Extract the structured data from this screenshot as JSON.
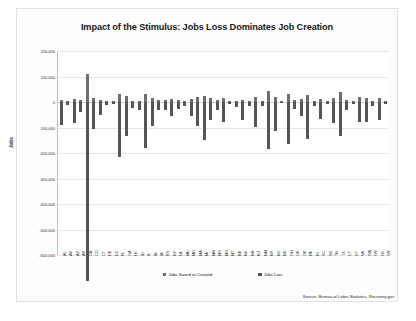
{
  "page": {
    "title": "Impact of the Stimulus: Jobs Loss Dominates Job Creation",
    "source": "Source: Bureau of Labor Statistics, Recovery.gov"
  },
  "legend": {
    "items": [
      {
        "label": "Jobs Saved or Created",
        "color": "#6e6e6e"
      },
      {
        "label": "Jobs Lost",
        "color": "#555555"
      }
    ]
  },
  "chart_data": {
    "type": "bar",
    "title": "Impact of the Stimulus: Jobs Loss Dominates Job Creation",
    "xlabel": "",
    "ylabel": "Jobs",
    "ylim": [
      -600000,
      200000
    ],
    "yticks": [
      200000,
      100000,
      0,
      -100000,
      -200000,
      -300000,
      -400000,
      -500000,
      -600000
    ],
    "ytick_labels": [
      "200,000",
      "100,000",
      "0",
      "-100,000",
      "-200,000",
      "-300,000",
      "-400,000",
      "-500,000",
      "-600,000"
    ],
    "grid": true,
    "legend_position": "bottom",
    "categories": [
      "AL",
      "AK",
      "AZ",
      "AR",
      "CA",
      "CO",
      "CT",
      "DE",
      "DC",
      "FL",
      "GA",
      "HI",
      "ID",
      "IL",
      "IN",
      "IA",
      "KS",
      "KY",
      "LA",
      "ME",
      "MD",
      "MA",
      "MI",
      "MN",
      "MS",
      "MO",
      "MT",
      "NE",
      "NV",
      "NH",
      "NJ",
      "NM",
      "NY",
      "NC",
      "ND",
      "OH",
      "OK",
      "OR",
      "PA",
      "RI",
      "SC",
      "SD",
      "TN",
      "TX",
      "UT",
      "VT",
      "VA",
      "WA",
      "WV",
      "WI",
      "WY"
    ],
    "series": [
      {
        "name": "Jobs Lost",
        "values": [
          -92000,
          -12000,
          -81000,
          -38000,
          -700000,
          -105000,
          -52000,
          -11000,
          -9000,
          -215000,
          -133000,
          -22000,
          -31000,
          -181000,
          -96000,
          -33000,
          -31000,
          -54000,
          -27000,
          -16000,
          -53000,
          -96000,
          -148000,
          -72000,
          -32000,
          -77000,
          -9000,
          -19000,
          -71000,
          -16000,
          -97000,
          -16000,
          -185000,
          -113000,
          -5000,
          -163000,
          -27000,
          -53000,
          -147000,
          -16000,
          -66000,
          -7000,
          -84000,
          -132000,
          -31000,
          -8000,
          -77000,
          -80000,
          -14000,
          -72000,
          -8000
        ]
      },
      {
        "name": "Jobs Saved or Created",
        "values": [
          9000,
          2000,
          11000,
          6000,
          110000,
          14000,
          8000,
          2000,
          3000,
          33000,
          22000,
          4000,
          5000,
          32000,
          16000,
          8000,
          7000,
          10000,
          8000,
          3000,
          12000,
          19000,
          22000,
          14000,
          7000,
          15000,
          2000,
          4000,
          7000,
          3000,
          20000,
          5000,
          45000,
          21000,
          2000,
          30000,
          8000,
          10000,
          28000,
          3000,
          11000,
          2000,
          14000,
          40000,
          7000,
          2000,
          18000,
          17000,
          4000,
          14000,
          2000
        ]
      }
    ]
  }
}
